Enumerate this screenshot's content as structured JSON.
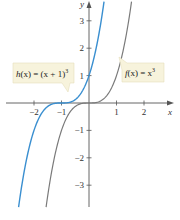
{
  "chart_data": {
    "type": "line",
    "title": "",
    "xlabel": "x",
    "ylabel": "y",
    "xlim": [
      -2.6,
      3.0
    ],
    "ylim": [
      -3.8,
      3.7
    ],
    "grid": false,
    "x_ticks": [
      "-2",
      "-1",
      "1",
      "2"
    ],
    "y_ticks": [
      "3",
      "2",
      "1",
      "-1",
      "-2",
      "-3"
    ],
    "series": [
      {
        "name": "h(x) = (x + 1)^3",
        "label_text": "h(x) = (x + 1)",
        "label_exp": "3",
        "color": "#3a8fd0",
        "function": "(x+1)^3",
        "points": [
          [
            -2.5,
            -3.375
          ],
          [
            -2,
            -1
          ],
          [
            -1.5,
            -0.125
          ],
          [
            -1,
            0
          ],
          [
            -0.5,
            0.125
          ],
          [
            0,
            1
          ],
          [
            0.5,
            3.375
          ]
        ]
      },
      {
        "name": "f(x) = x^3",
        "label_text": "f(x) = x",
        "label_exp": "3",
        "color": "#7a7a7a",
        "function": "x^3",
        "points": [
          [
            -1.5,
            -3.375
          ],
          [
            -1,
            -1
          ],
          [
            -0.5,
            -0.125
          ],
          [
            0,
            0
          ],
          [
            0.5,
            0.125
          ],
          [
            1,
            1
          ],
          [
            1.5,
            3.375
          ]
        ]
      }
    ],
    "label_box_color": "#f7f3dc"
  },
  "axes": {
    "x_label": "x",
    "y_label": "y",
    "x_ticks": [
      {
        "label": "−2",
        "value": -2
      },
      {
        "label": "−1",
        "value": -1
      },
      {
        "label": "1",
        "value": 1
      },
      {
        "label": "2",
        "value": 2
      }
    ],
    "y_ticks": [
      {
        "label": "3",
        "value": 3
      },
      {
        "label": "2",
        "value": 2
      },
      {
        "label": "1",
        "value": 1
      },
      {
        "label": "−1",
        "value": -1
      },
      {
        "label": "−2",
        "value": -2
      },
      {
        "label": "−3",
        "value": -3
      }
    ]
  },
  "labels": {
    "h": {
      "prefix": "h",
      "mid": "(x) = (x + 1)",
      "exp": "3"
    },
    "f": {
      "prefix": "f",
      "mid": "(x) = x",
      "exp": "3"
    }
  }
}
